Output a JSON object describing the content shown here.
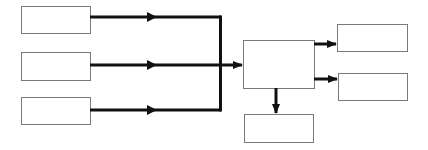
{
  "diagram": {
    "title": "",
    "colors": {
      "background": "#ffffff",
      "box_stroke": "#7a7a7a",
      "box_fill": "#ffffff",
      "connector": "#111111"
    },
    "nodes": [
      {
        "id": "input-1",
        "label": "",
        "x": 21,
        "y": 6,
        "w": 69,
        "h": 27
      },
      {
        "id": "input-2",
        "label": "",
        "x": 21,
        "y": 52,
        "w": 69,
        "h": 28
      },
      {
        "id": "input-3",
        "label": "",
        "x": 21,
        "y": 97,
        "w": 69,
        "h": 27
      },
      {
        "id": "center",
        "label": "",
        "x": 243,
        "y": 40,
        "w": 71,
        "h": 48
      },
      {
        "id": "output-top",
        "label": "",
        "x": 337,
        "y": 24,
        "w": 70,
        "h": 27
      },
      {
        "id": "output-middle",
        "label": "",
        "x": 338,
        "y": 73,
        "w": 69,
        "h": 27
      },
      {
        "id": "output-bottom",
        "label": "",
        "x": 244,
        "y": 114,
        "w": 69,
        "h": 28
      }
    ],
    "edges": [
      {
        "from": "input-1",
        "to": "center",
        "label": ""
      },
      {
        "from": "input-2",
        "to": "center",
        "label": ""
      },
      {
        "from": "input-3",
        "to": "center",
        "label": ""
      },
      {
        "from": "center",
        "to": "output-top",
        "label": ""
      },
      {
        "from": "center",
        "to": "output-middle",
        "label": ""
      },
      {
        "from": "center",
        "to": "output-bottom",
        "label": ""
      }
    ]
  }
}
